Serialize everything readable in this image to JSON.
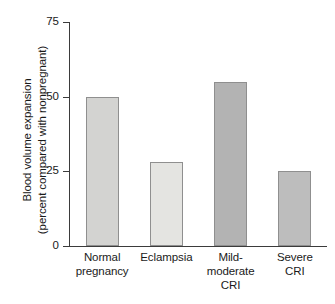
{
  "chart_data": {
    "type": "bar",
    "title": "",
    "subtitle": "",
    "xlabel": "",
    "ylabel_line1": "Blood volume expansion",
    "ylabel_line2": "(percent compared with nonpregnant)",
    "categories": [
      "Normal pregnancy",
      "Eclampsia",
      "Mild-moderate CRI",
      "Severe CRI"
    ],
    "category_lines": [
      [
        "Normal",
        "pregnancy"
      ],
      [
        "Eclampsia"
      ],
      [
        "Mild-",
        "moderate",
        "CRI"
      ],
      [
        "Severe",
        "CRI"
      ]
    ],
    "values": [
      50,
      28,
      55,
      25
    ],
    "bar_colors": [
      "#d3d3d1",
      "#e4e4e1",
      "#b3b3b3",
      "#bdbdbd"
    ],
    "bar_border_color": "#8f8f8f",
    "ylim": [
      0,
      75
    ],
    "yticks": [
      0,
      25,
      50,
      75
    ],
    "ytick_labels": [
      "0",
      "25",
      "50",
      "75"
    ],
    "grid": false,
    "legend": false,
    "legend_position": "none",
    "axis_color": "#3b3b3b",
    "background": "#ffffff"
  }
}
